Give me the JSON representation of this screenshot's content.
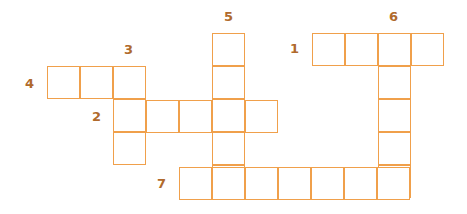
{
  "puzzle": {
    "type": "crossword",
    "border_color": "#f0a04b",
    "number_color": "#b06a2c",
    "cell_size": 33,
    "clue_numbers": [
      {
        "n": "1",
        "x": 290,
        "y": 42
      },
      {
        "n": "2",
        "x": 92,
        "y": 110
      },
      {
        "n": "3",
        "x": 124,
        "y": 43
      },
      {
        "n": "4",
        "x": 25,
        "y": 77
      },
      {
        "n": "5",
        "x": 224,
        "y": 10
      },
      {
        "n": "6",
        "x": 389,
        "y": 10
      },
      {
        "n": "7",
        "x": 157,
        "y": 177
      }
    ],
    "words": [
      {
        "number": "1",
        "direction": "across",
        "length": 4,
        "col0x": 312,
        "row0y": 33
      },
      {
        "number": "2",
        "direction": "across",
        "length": 5,
        "col0x": 113,
        "row0y": 100
      },
      {
        "number": "3",
        "direction": "down",
        "length": 3,
        "col0x": 113,
        "row0y": 66
      },
      {
        "number": "4",
        "direction": "across",
        "length": 3,
        "col0x": 47,
        "row0y": 66
      },
      {
        "number": "5",
        "direction": "down",
        "length": 5,
        "col0x": 212,
        "row0y": 33
      },
      {
        "number": "6",
        "direction": "down",
        "length": 5,
        "col0x": 378,
        "row0y": 33
      },
      {
        "number": "7",
        "direction": "across",
        "length": 7,
        "col0x": 179,
        "row0y": 167
      }
    ]
  }
}
